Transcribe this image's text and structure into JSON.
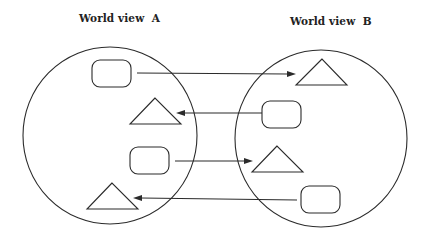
{
  "title_left": "World view  A",
  "title_right": "World view  B",
  "colors": {
    "stroke": "#2b2b2b",
    "background": "#ffffff",
    "text": "#222222"
  },
  "world_views": [
    {
      "label": "World view  A",
      "shape": "circle",
      "elements": [
        {
          "type": "rounded-rectangle",
          "order": 1
        },
        {
          "type": "triangle",
          "order": 2
        },
        {
          "type": "rounded-rectangle",
          "order": 3
        },
        {
          "type": "triangle",
          "order": 4
        }
      ]
    },
    {
      "label": "World view  B",
      "shape": "circle",
      "elements": [
        {
          "type": "triangle",
          "order": 1
        },
        {
          "type": "rounded-rectangle",
          "order": 2
        },
        {
          "type": "triangle",
          "order": 3
        },
        {
          "type": "rounded-rectangle",
          "order": 4
        }
      ]
    }
  ],
  "mappings": [
    {
      "from": "A.rounded-rectangle-1",
      "to": "B.triangle-1",
      "direction": "A→B"
    },
    {
      "from": "B.rounded-rectangle-2",
      "to": "A.triangle-2",
      "direction": "B→A"
    },
    {
      "from": "A.rounded-rectangle-3",
      "to": "B.triangle-3",
      "direction": "A→B"
    },
    {
      "from": "B.rounded-rectangle-4",
      "to": "A.triangle-4",
      "direction": "B→A"
    }
  ]
}
